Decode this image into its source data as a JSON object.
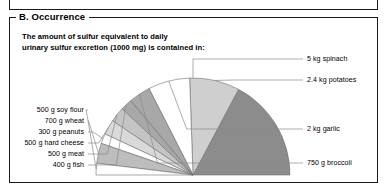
{
  "panel": {
    "title": "B. Occurrence",
    "caption_line1": "The amount of sulfur equivalent to daily",
    "caption_line2": "urinary sulfur excretion (1000 mg) is contained in:"
  },
  "colors": {
    "dark_gray": "#8c8c8c",
    "medium_gray": "#a8a8a8",
    "light_gray": "#cfcfcf",
    "pale_gray": "#e2e2e2",
    "white": "#ffffff",
    "outline": "#6e6e6e",
    "leader": "#8a8a8a",
    "frame": "#1a1a1a",
    "text": "#000000"
  },
  "chart_data": {
    "type": "pie",
    "title": "The amount of sulfur equivalent to daily urinary sulfur excretion (1000 mg) is contained in:",
    "subtitle": "",
    "xlabel": "",
    "ylabel": "",
    "legend_position": "callout-labels",
    "grid": false,
    "shape": "semicircle",
    "total_degrees": 180,
    "note": "Half-pie (180 degrees); wedge angle is proportional to the mass of food needed to supply 1000 mg sulfur.",
    "categories": [
      "5 kg spinach",
      "2.4 kg potatoes",
      "2 kg garlic",
      "750 g broccoli",
      "400 g fish",
      "500 g meat",
      "500 g hard cheese",
      "300 g peanuts",
      "700 g wheat",
      "500 g soy flour"
    ],
    "values": [
      5000,
      2400,
      2000,
      750,
      400,
      500,
      500,
      300,
      700,
      500
    ],
    "units": "g",
    "slice_degrees": [
      62,
      30,
      25,
      13,
      7,
      9,
      9,
      6,
      12,
      7
    ],
    "slice_colors": [
      "#8c8c8c",
      "#cfcfcf",
      "#ffffff",
      "#a8a8a8",
      "#a8a8a8",
      "#c4c4c4",
      "#d9d9d9",
      "#ffffff",
      "#bdbdbd",
      "#ffffff"
    ]
  },
  "labels": {
    "right": [
      {
        "text": "5 kg spinach",
        "x": 307,
        "y": 59
      },
      {
        "text": "2.4 kg potatoes",
        "x": 307,
        "y": 80
      },
      {
        "text": "2 kg garlic",
        "x": 307,
        "y": 129
      },
      {
        "text": "750 g broccoli",
        "x": 307,
        "y": 163
      }
    ],
    "left": [
      {
        "text": "500 g soy flour",
        "x": 84,
        "y": 110
      },
      {
        "text": "700 g wheat",
        "x": 84,
        "y": 121
      },
      {
        "text": "300 g peanuts",
        "x": 84,
        "y": 132
      },
      {
        "text": "500 g hard cheese",
        "x": 84,
        "y": 143
      },
      {
        "text": "500 g meat",
        "x": 84,
        "y": 154
      },
      {
        "text": "400 g fish",
        "x": 84,
        "y": 165
      }
    ]
  }
}
